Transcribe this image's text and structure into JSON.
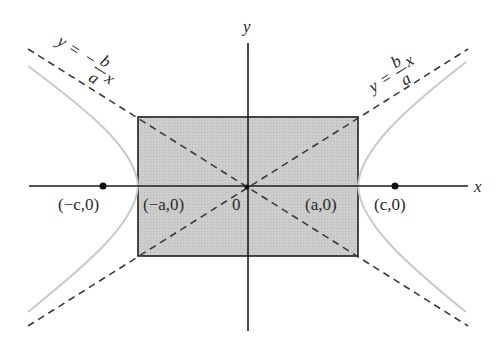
{
  "diagram": {
    "type": "hyperbola",
    "axes": {
      "x_label": "x",
      "y_label": "y",
      "origin_label": "0"
    },
    "asymptotes": [
      {
        "name": "negative",
        "lhs": "y",
        "eq": "=",
        "sign": "−",
        "num": "b",
        "den": "a",
        "var": "x"
      },
      {
        "name": "positive",
        "lhs": "y",
        "eq": "=",
        "sign": "",
        "num": "b",
        "den": "a",
        "var": "x"
      }
    ],
    "points": {
      "left_focus": "(−c,0)",
      "left_vertex": "(−a,0)",
      "right_vertex": "(a,0)",
      "right_focus": "(c,0)"
    },
    "colors": {
      "rectangle_fill": "#c9c9c9",
      "curve": "#c8c8c8",
      "lines": "#222222",
      "dashes": "#444444"
    }
  }
}
